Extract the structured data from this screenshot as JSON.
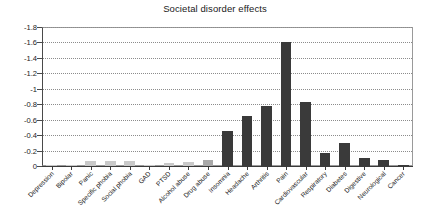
{
  "chart_data": {
    "type": "bar",
    "title": "Societal disorder effects",
    "xlabel": "",
    "ylabel": "",
    "ylim": [
      -1.8,
      0
    ],
    "y_inverted": true,
    "grid": true,
    "legend": "none",
    "ytick_labels": [
      "-1.8",
      "-1.6",
      "-1.4",
      "-1.2",
      "-1",
      "-0.8",
      "-0.6",
      "-0.4",
      "-0.2",
      "0"
    ],
    "ytick_values": [
      -1.8,
      -1.6,
      -1.4,
      -1.2,
      -1.0,
      -0.8,
      -0.6,
      -0.4,
      -0.2,
      0
    ],
    "categories": [
      "Depression",
      "Bipolar",
      "Panic",
      "Specific phobia",
      "Social phobia",
      "GAD",
      "PTSD",
      "Alcohol abuse",
      "Drug abuse",
      "Insomnia",
      "Headache",
      "Arthritis",
      "Pain",
      "Cardiovascular",
      "Respiratory",
      "Diabetes",
      "Digestive",
      "Neurological",
      "Cancer"
    ],
    "values": [
      -0.01,
      -0.01,
      -0.06,
      -0.06,
      -0.06,
      -0.01,
      -0.04,
      -0.05,
      -0.08,
      -0.45,
      -0.65,
      -0.78,
      -1.6,
      -0.83,
      -0.17,
      -0.3,
      -0.1,
      -0.08,
      -0.01
    ],
    "bar_colors": [
      "#c9c9c9",
      "#c9c9c9",
      "#c9c9c9",
      "#c9c9c9",
      "#c9c9c9",
      "#c9c9c9",
      "#c9c9c9",
      "#c9c9c9",
      "#a8a8a8",
      "#3a3a3a",
      "#3a3a3a",
      "#3a3a3a",
      "#3a3a3a",
      "#3a3a3a",
      "#3a3a3a",
      "#3a3a3a",
      "#3a3a3a",
      "#3a3a3a",
      "#3a3a3a"
    ]
  },
  "style": {
    "axis_color": "#3a3a3a",
    "grid_color": "#8c8c8c",
    "text_color": "#1a1a1a",
    "background": "#ffffff"
  }
}
